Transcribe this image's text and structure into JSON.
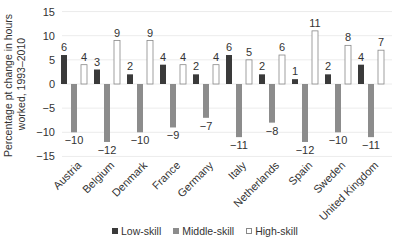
{
  "chart_data": {
    "type": "bar",
    "title": "",
    "xlabel": "",
    "ylabel": "Percentage pt change in hours worked, 1993–2010",
    "ylim": [
      -15,
      15
    ],
    "yticks": [
      15,
      10,
      5,
      0,
      -5,
      -10,
      -15
    ],
    "ytick_labels": [
      "15",
      "10",
      "5",
      "0",
      "−5",
      "−10",
      "−15"
    ],
    "grid": true,
    "legend_position": "bottom",
    "categories": [
      "Austria",
      "Belgium",
      "Denmark",
      "France",
      "Germany",
      "Italy",
      "Netherlands",
      "Spain",
      "Sweden",
      "United Kingdom"
    ],
    "series": [
      {
        "name": "Low-skill",
        "color": "#3a3a3a",
        "values": [
          6,
          3,
          2,
          4,
          2,
          6,
          2,
          1,
          2,
          4
        ]
      },
      {
        "name": "Middle-skill",
        "color": "#8c8c8c",
        "values": [
          -10,
          -12,
          -10,
          -9,
          -7,
          -11,
          -8,
          -12,
          -10,
          -11
        ]
      },
      {
        "name": "High-skill",
        "color": "#ffffff",
        "values": [
          4,
          9,
          9,
          4,
          4,
          5,
          6,
          11,
          8,
          7
        ]
      }
    ]
  },
  "legend": {
    "items": [
      {
        "label": "Low-skill",
        "color": "#3a3a3a"
      },
      {
        "label": "Middle-skill",
        "color": "#8c8c8c"
      },
      {
        "label": "High-skill",
        "color": "#ffffff"
      }
    ]
  }
}
